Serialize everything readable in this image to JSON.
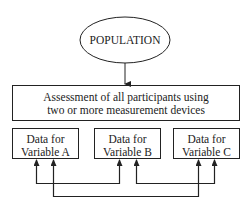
{
  "diagram": {
    "population": {
      "label": "POPULATION"
    },
    "assessment": {
      "line1": "Assessment of all participants using",
      "line2": "two or more measurement devices"
    },
    "variables": [
      {
        "line1": "Data for",
        "line2": "Variable A"
      },
      {
        "line1": "Data for",
        "line2": "Variable B"
      },
      {
        "line1": "Data for",
        "line2": "Variable C"
      }
    ],
    "connections": [
      {
        "from": "Variable A",
        "to": "Variable B"
      },
      {
        "from": "Variable B",
        "to": "Variable C"
      },
      {
        "from": "Variable A",
        "to": "Variable C"
      }
    ],
    "line_color": "#222222"
  }
}
